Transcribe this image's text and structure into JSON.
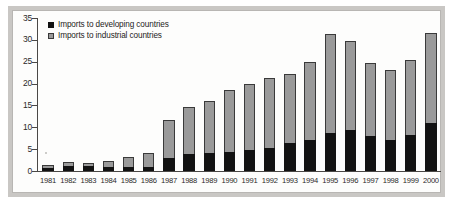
{
  "chart_data": {
    "type": "bar",
    "subtype": "stacked-vertical",
    "title": "",
    "xlabel": "",
    "ylabel": "",
    "ylim": [
      0,
      35
    ],
    "yticks": [
      0,
      5,
      10,
      15,
      20,
      25,
      30,
      35
    ],
    "ytick_labels": [
      "0",
      "5",
      "10",
      "15",
      "20",
      "25",
      "30",
      "35"
    ],
    "grid": false,
    "legend_position": "top-left",
    "categories": [
      "1981",
      "1982",
      "1983",
      "1984",
      "1985",
      "1986",
      "1987",
      "1988",
      "1989",
      "1990",
      "1991",
      "1992",
      "1993",
      "1994",
      "1995",
      "1996",
      "1997",
      "1998",
      "1999",
      "2000"
    ],
    "series": [
      {
        "name": "Imports to developing countries",
        "color": "#121212",
        "values": [
          0.6,
          1.2,
          1.2,
          1.0,
          1.0,
          0.9,
          3.0,
          3.8,
          4.1,
          4.3,
          4.9,
          5.2,
          6.3,
          7.0,
          8.8,
          9.3,
          7.9,
          7.2,
          8.2,
          10.9
        ]
      },
      {
        "name": "Imports to industrial countries",
        "color": "#9a9a9a",
        "values": [
          0.8,
          0.8,
          0.7,
          1.4,
          2.1,
          3.3,
          8.7,
          10.8,
          12.0,
          14.2,
          15.1,
          16.0,
          15.9,
          17.9,
          22.5,
          20.5,
          16.7,
          16.0,
          17.2,
          20.6
        ]
      }
    ],
    "totals": [
      1.4,
      2.0,
      1.9,
      2.4,
      3.1,
      4.2,
      11.7,
      14.6,
      16.1,
      18.5,
      20.0,
      21.2,
      22.2,
      24.9,
      31.3,
      29.8,
      24.6,
      23.2,
      25.4,
      31.5
    ]
  },
  "legend": {
    "items": [
      {
        "label": "Imports to developing countries",
        "swatch": "black-square-icon"
      },
      {
        "label": "Imports to industrial countries",
        "swatch": "gray-square-icon"
      }
    ]
  },
  "colors": {
    "developing": "#121212",
    "industrial": "#9a9a9a",
    "plot_background": "#fdfdfc",
    "frame_band": "#c9c7c4",
    "axis": "#4a4846",
    "text": "#2b2a29"
  }
}
